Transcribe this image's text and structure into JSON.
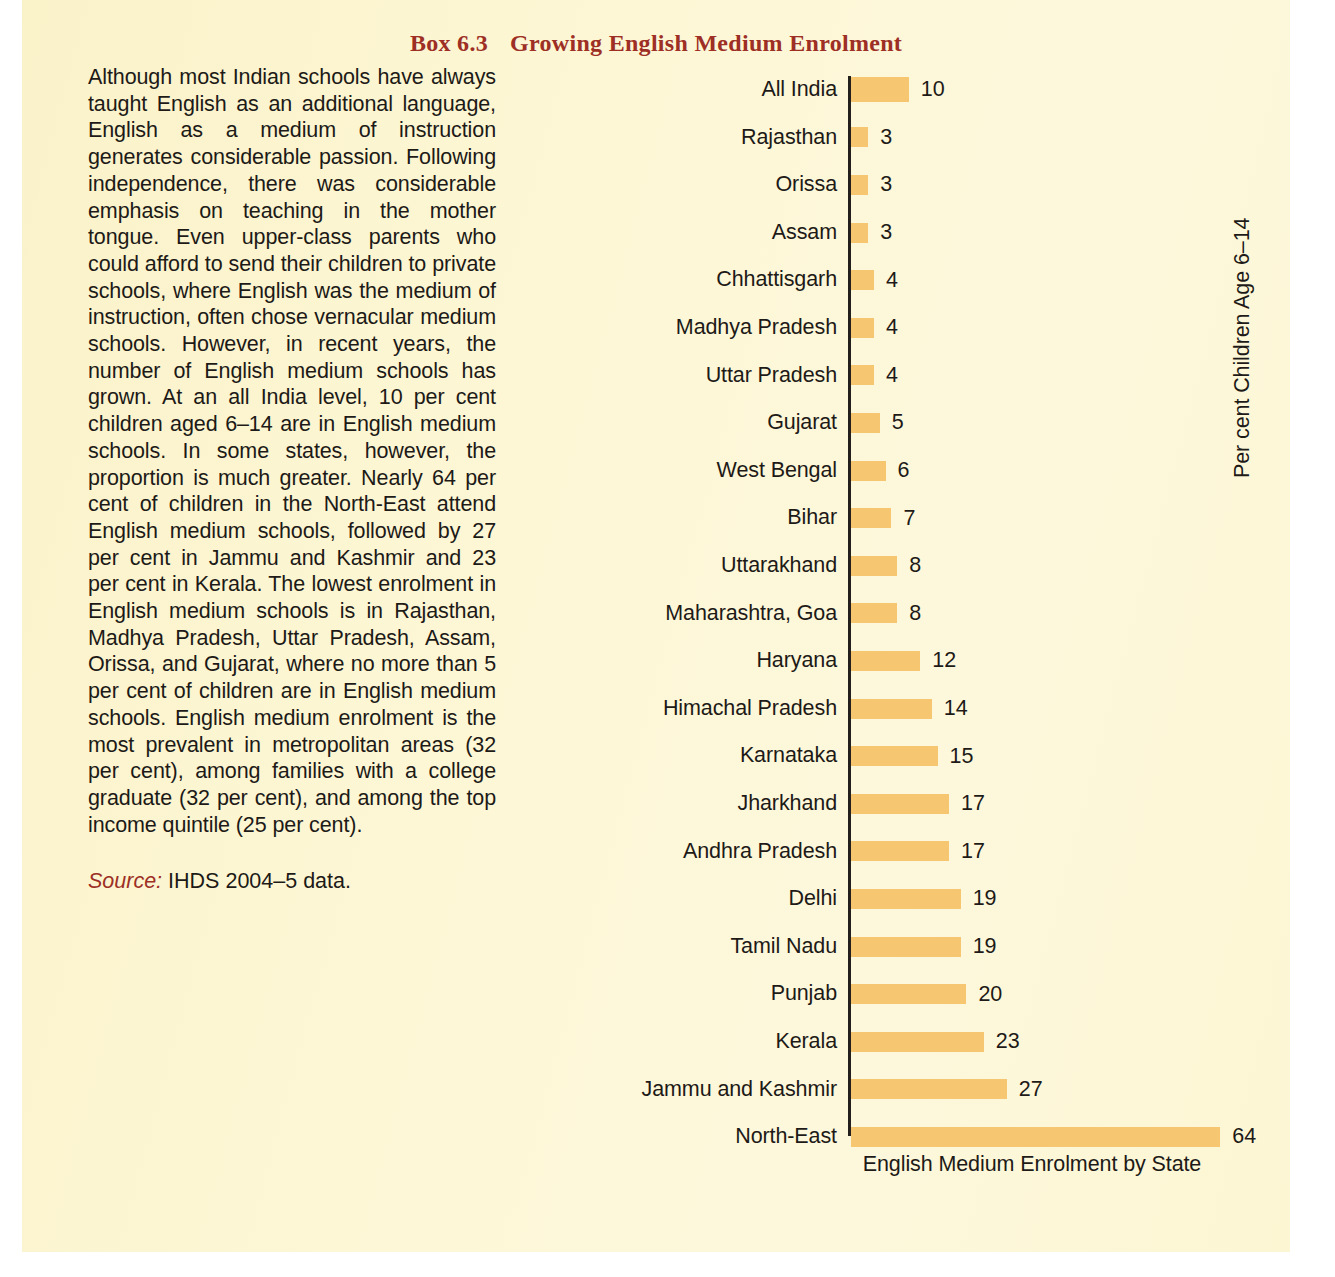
{
  "box": {
    "number": "Box 6.3",
    "title": "Growing English Medium Enrolment",
    "title_color": "#9d2f25"
  },
  "text": {
    "body": "Although most Indian schools have always taught English as an additional language, English as a medium of instruction generates considerable passion. Following independence, there was considerable emphasis on teaching in the mother tongue. Even upper-class parents who could afford to send their children to private schools, where English was the medium of instruction, often chose vernacular medium schools. However, in recent years, the number of English medium schools has grown. At an all India level, 10 per cent children aged 6–14 are in English medium schools. In some states, however, the proportion is much greater. Nearly 64 per cent of children in the North-East attend English medium schools, followed by 27 per cent in Jammu and Kashmir and 23 per cent in Kerala. The lowest enrolment in English medium schools is in Rajasthan, Madhya Pradesh, Uttar Pradesh, Assam, Orissa, and Gujarat, where no more than 5 per cent of children are in English medium schools. English medium enrolment is the most prevalent in metropolitan areas (32 per cent), among families with a college graduate (32 per cent), and among the top income quintile (25 per cent).",
    "source_label": "Source:",
    "source_value": "IHDS 2004–5 data."
  },
  "chart_data": {
    "type": "bar",
    "orientation": "horizontal",
    "title": "",
    "xlabel": "English Medium Enrolment by State",
    "ylabel": "Per cent Children Age 6–14",
    "xlim": [
      0,
      64
    ],
    "grid": false,
    "legend": null,
    "bar_color": "#f6c670",
    "axis_color": "#231f1c",
    "categories": [
      "All India",
      "Rajasthan",
      "Orissa",
      "Assam",
      "Chhattisgarh",
      "Madhya Pradesh",
      "Uttar Pradesh",
      "Gujarat",
      "West Bengal",
      "Bihar",
      "Uttarakhand",
      "Maharashtra, Goa",
      "Haryana",
      "Himachal Pradesh",
      "Karnataka",
      "Jharkhand",
      "Andhra Pradesh",
      "Delhi",
      "Tamil Nadu",
      "Punjab",
      "Kerala",
      "Jammu and Kashmir",
      "North-East"
    ],
    "values": [
      10,
      3,
      3,
      3,
      4,
      4,
      4,
      5,
      6,
      7,
      8,
      8,
      12,
      14,
      15,
      17,
      17,
      19,
      19,
      20,
      23,
      27,
      64
    ],
    "data_labels": [
      "10",
      "3",
      "3",
      "3",
      "4",
      "4",
      "4",
      "5",
      "6",
      "7",
      "8",
      "8",
      "12",
      "14",
      "15",
      "17",
      "17",
      "19",
      "19",
      "20",
      "23",
      "27",
      "64"
    ],
    "emphasized": [
      "All India"
    ]
  }
}
